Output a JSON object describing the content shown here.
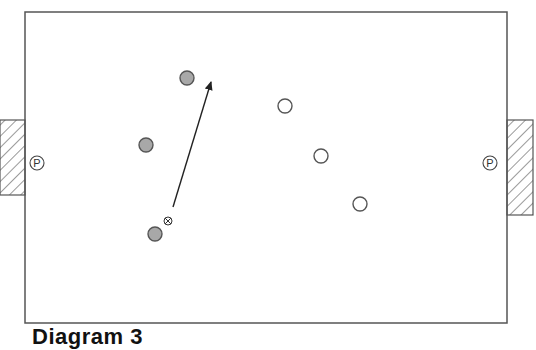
{
  "diagram": {
    "caption": "Diagram 3",
    "field": {
      "x": 25,
      "y": 12,
      "width": 482,
      "height": 311,
      "stroke": "#555555"
    },
    "goals": [
      {
        "id": "left-goal",
        "x": 0,
        "y": 120,
        "width": 25,
        "height": 75
      },
      {
        "id": "right-goal",
        "x": 507,
        "y": 120,
        "width": 26,
        "height": 95
      }
    ],
    "goalkeeper_markers": [
      {
        "id": "left-goalkeeper",
        "label": "P",
        "cx": 37,
        "cy": 163
      },
      {
        "id": "right-goalkeeper",
        "label": "P",
        "cx": 490,
        "cy": 163
      }
    ],
    "team_grey": {
      "fill": "#a8a8a8",
      "stroke": "#555555",
      "players": [
        {
          "cx": 187,
          "cy": 78
        },
        {
          "cx": 146,
          "cy": 145
        },
        {
          "cx": 155,
          "cy": 234
        }
      ]
    },
    "team_white": {
      "fill": "#ffffff",
      "stroke": "#555555",
      "players": [
        {
          "cx": 285,
          "cy": 106
        },
        {
          "cx": 321,
          "cy": 156
        },
        {
          "cx": 360,
          "cy": 204
        }
      ]
    },
    "ball": {
      "cx": 168,
      "cy": 221
    },
    "pass_arrow": {
      "x1": 173,
      "y1": 207,
      "x2": 211,
      "y2": 82
    }
  }
}
